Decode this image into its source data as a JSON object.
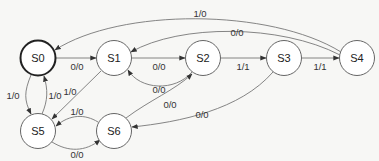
{
  "diagram": {
    "type": "finite-state-machine",
    "states": [
      {
        "id": "S0",
        "label": "S0",
        "x": 38,
        "y": 58,
        "initial": true
      },
      {
        "id": "S1",
        "label": "S1",
        "x": 114,
        "y": 58,
        "initial": false
      },
      {
        "id": "S2",
        "label": "S2",
        "x": 203,
        "y": 58,
        "initial": false
      },
      {
        "id": "S3",
        "label": "S3",
        "x": 284,
        "y": 58,
        "initial": false
      },
      {
        "id": "S4",
        "label": "S4",
        "x": 357,
        "y": 58,
        "initial": false
      },
      {
        "id": "S5",
        "label": "S5",
        "x": 38,
        "y": 131,
        "initial": false
      },
      {
        "id": "S6",
        "label": "S6",
        "x": 114,
        "y": 131,
        "initial": false
      }
    ],
    "transitions": [
      {
        "from": "S4",
        "to": "S0",
        "label": "1/0"
      },
      {
        "from": "S4",
        "to": "S1",
        "label": "0/0"
      },
      {
        "from": "S0",
        "to": "S1",
        "label": "0/0"
      },
      {
        "from": "S1",
        "to": "S2",
        "label": "0/0"
      },
      {
        "from": "S2",
        "to": "S1",
        "label": "0/0"
      },
      {
        "from": "S2",
        "to": "S3",
        "label": "1/1"
      },
      {
        "from": "S3",
        "to": "S4",
        "label": "1/1"
      },
      {
        "from": "S0",
        "to": "S5",
        "label": "1/0"
      },
      {
        "from": "S5",
        "to": "S0",
        "label": "1/0"
      },
      {
        "from": "S1",
        "to": "S5",
        "label": "1/0"
      },
      {
        "from": "S6",
        "to": "S2",
        "label": "0/0"
      },
      {
        "from": "S3",
        "to": "S6",
        "label": "0/0"
      },
      {
        "from": "S6",
        "to": "S5",
        "label": "1/0"
      },
      {
        "from": "S5",
        "to": "S6",
        "label": "0/0"
      }
    ]
  }
}
